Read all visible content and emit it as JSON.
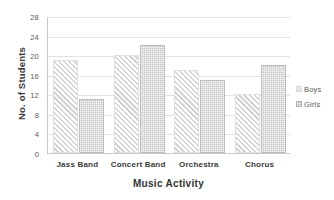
{
  "chart_data": {
    "type": "bar",
    "title": "",
    "subtitle": "",
    "xlabel": "Music Activity",
    "ylabel": "No. of Students",
    "categories": [
      "Jass Band",
      "Concert Band",
      "Orchestra",
      "Chorus"
    ],
    "series": [
      {
        "name": "Boys",
        "values": [
          19,
          20,
          17,
          12
        ]
      },
      {
        "name": "Girls",
        "values": [
          11,
          22,
          15,
          18
        ]
      }
    ],
    "ylim": [
      0,
      28
    ],
    "y_ticks": [
      0,
      4,
      8,
      12,
      16,
      20,
      24,
      28
    ],
    "y_tick_labels": [
      "0",
      "4",
      "8",
      "12",
      "16",
      "20",
      "24",
      "28"
    ],
    "grid": "horizontal",
    "legend_position": "right",
    "legend": [
      {
        "label": "Boys",
        "pattern": "diagonal-hatch",
        "color": "#d4d4d4"
      },
      {
        "label": "Girls",
        "pattern": "stipple-fill",
        "color": "#c5c5c5"
      }
    ],
    "colors": {
      "boys": "#d4d4d4",
      "girls": "#c5c5c5",
      "gridline": "#e2e2e2",
      "axis": "#c8c8c8",
      "text": "#3a3a3a",
      "background": "#ffffff"
    }
  }
}
